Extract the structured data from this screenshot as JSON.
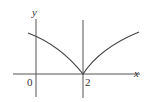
{
  "figure": {
    "axis_labels": {
      "x": "x",
      "y": "y"
    },
    "tick_labels": {
      "origin": "0",
      "cusp": "2"
    },
    "colors": {
      "axes": "#555555",
      "curve": "#444444"
    }
  }
}
